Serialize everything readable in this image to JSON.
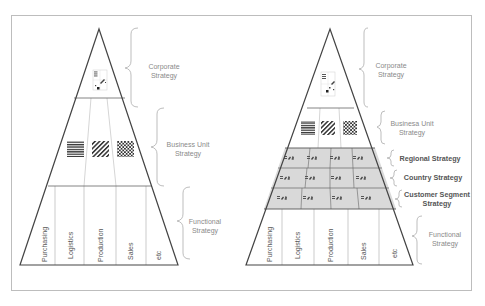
{
  "diagram": {
    "type": "strategy-pyramid-comparison",
    "colors": {
      "frame": "#bdbdbd",
      "pyramid_stroke": "#444444",
      "inner_lines": "#9a9a9a",
      "gray_band": "#d9d9d9",
      "brace": "#b5b5b5",
      "label_light": "#8a8a8a",
      "label_bold": "#555555"
    },
    "left_pyramid": {
      "levels": [
        {
          "label": "Corporate Strategy",
          "line1": "Corporate",
          "line2": "Strategy",
          "icon": "corporate-pattern-icon"
        },
        {
          "label": "Business Unit Strategy",
          "line1": "Business Unit",
          "line2": "Strategy",
          "icons": [
            "horizontal-stripes-icon",
            "diagonal-stripes-icon",
            "checkerboard-icon"
          ]
        },
        {
          "label": "Functional Strategy",
          "line1": "Functional",
          "line2": "Strategy"
        }
      ],
      "functions": [
        "Purchasing",
        "Logistics",
        "Production",
        "Sales",
        "etc"
      ]
    },
    "right_pyramid": {
      "levels": [
        {
          "label": "Corporate Strategy",
          "line1": "Corporate",
          "line2": "Strategy",
          "icon": "corporate-pattern-icon"
        },
        {
          "label": "Businesa Unit Strategy",
          "line1": "Businesa Unit",
          "line2": "Strategy",
          "icons": [
            "horizontal-stripes-icon",
            "diagonal-stripes-icon",
            "checkerboard-icon"
          ]
        },
        {
          "label": "Regional Strategy",
          "line1": "Regional Strategy",
          "bold": true
        },
        {
          "label": "Country Strategy",
          "line1": "Country Strategy",
          "bold": true
        },
        {
          "label": "Customer Segment Strategy",
          "line1": "Customer Segment",
          "line2": "Strategy",
          "bold": true
        },
        {
          "label": "Functional Strategy",
          "line1": "Functional",
          "line2": "Strategy"
        }
      ],
      "functions": [
        "Purchasing",
        "Logistics",
        "Production",
        "Sales",
        "etc"
      ],
      "matrix_rows": 3,
      "matrix_cols": 4
    }
  }
}
